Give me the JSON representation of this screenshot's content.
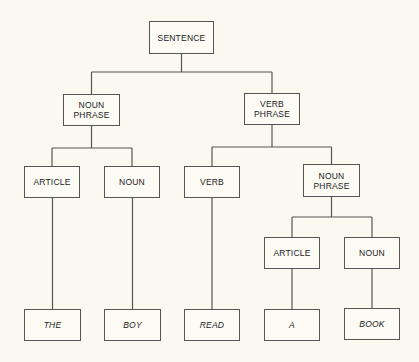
{
  "diagram": {
    "type": "parse-tree",
    "colors": {
      "background": "#fbf9ef",
      "line": "#555555",
      "text": "#222222"
    },
    "nodes": [
      {
        "id": "sentence",
        "label": "SENTENCE",
        "x": 149,
        "y": 21,
        "w": 65,
        "h": 33,
        "leaf": false
      },
      {
        "id": "np1",
        "label": "NOUN\nPHRASE",
        "x": 63,
        "y": 94,
        "w": 57,
        "h": 32,
        "leaf": false
      },
      {
        "id": "vp",
        "label": "VERB\nPHRASE",
        "x": 244,
        "y": 93,
        "w": 56,
        "h": 32,
        "leaf": false
      },
      {
        "id": "art1",
        "label": "ARTICLE",
        "x": 24,
        "y": 166,
        "w": 56,
        "h": 32,
        "leaf": false
      },
      {
        "id": "noun1",
        "label": "NOUN",
        "x": 104,
        "y": 166,
        "w": 56,
        "h": 32,
        "leaf": false
      },
      {
        "id": "verb",
        "label": "VERB",
        "x": 184,
        "y": 166,
        "w": 56,
        "h": 32,
        "leaf": false
      },
      {
        "id": "np2",
        "label": "NOUN\nPHRASE",
        "x": 303,
        "y": 164,
        "w": 57,
        "h": 33,
        "leaf": false
      },
      {
        "id": "art2",
        "label": "ARTICLE",
        "x": 264,
        "y": 237,
        "w": 56,
        "h": 32,
        "leaf": false
      },
      {
        "id": "noun2",
        "label": "NOUN",
        "x": 344,
        "y": 237,
        "w": 56,
        "h": 32,
        "leaf": false
      },
      {
        "id": "the",
        "label": "THE",
        "x": 24,
        "y": 309,
        "w": 57,
        "h": 32,
        "leaf": true
      },
      {
        "id": "boy",
        "label": "BOY",
        "x": 104,
        "y": 309,
        "w": 57,
        "h": 32,
        "leaf": true
      },
      {
        "id": "read",
        "label": "READ",
        "x": 184,
        "y": 309,
        "w": 56,
        "h": 32,
        "leaf": true
      },
      {
        "id": "a",
        "label": "A",
        "x": 264,
        "y": 309,
        "w": 56,
        "h": 32,
        "leaf": true
      },
      {
        "id": "book",
        "label": "BOOK",
        "x": 344,
        "y": 308,
        "w": 56,
        "h": 32,
        "leaf": true
      }
    ],
    "edges": [
      {
        "parent": "sentence",
        "children": [
          "np1",
          "vp"
        ],
        "bar_y": 72
      },
      {
        "parent": "np1",
        "children": [
          "art1",
          "noun1"
        ],
        "bar_y": 148
      },
      {
        "parent": "vp",
        "children": [
          "verb",
          "np2"
        ],
        "bar_y": 147
      },
      {
        "parent": "np2",
        "children": [
          "art2",
          "noun2"
        ],
        "bar_y": 217
      },
      {
        "parent": "art1",
        "children": [
          "the"
        ]
      },
      {
        "parent": "noun1",
        "children": [
          "boy"
        ]
      },
      {
        "parent": "verb",
        "children": [
          "read"
        ]
      },
      {
        "parent": "art2",
        "children": [
          "a"
        ]
      },
      {
        "parent": "noun2",
        "children": [
          "book"
        ]
      }
    ]
  }
}
